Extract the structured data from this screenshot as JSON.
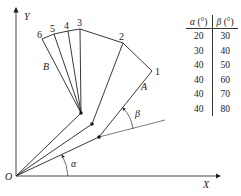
{
  "figure": {
    "axes": {
      "origin_label": "O",
      "x_label": "X",
      "y_label": "Y"
    },
    "arm_labels": {
      "A": "A",
      "B": "B"
    },
    "angle_labels": {
      "alpha": "α",
      "beta": "β"
    },
    "position_labels": [
      "1",
      "2",
      "3",
      "4",
      "5",
      "6"
    ],
    "table": {
      "headers": [
        {
          "symbol": "α",
          "unit": " (°)"
        },
        {
          "symbol": "β",
          "unit": " (°)"
        }
      ],
      "rows": [
        {
          "alpha": "20",
          "beta": "30"
        },
        {
          "alpha": "30",
          "beta": "40"
        },
        {
          "alpha": "40",
          "beta": "50"
        },
        {
          "alpha": "40",
          "beta": "60"
        },
        {
          "alpha": "40",
          "beta": "70"
        },
        {
          "alpha": "40",
          "beta": "80"
        }
      ]
    }
  }
}
